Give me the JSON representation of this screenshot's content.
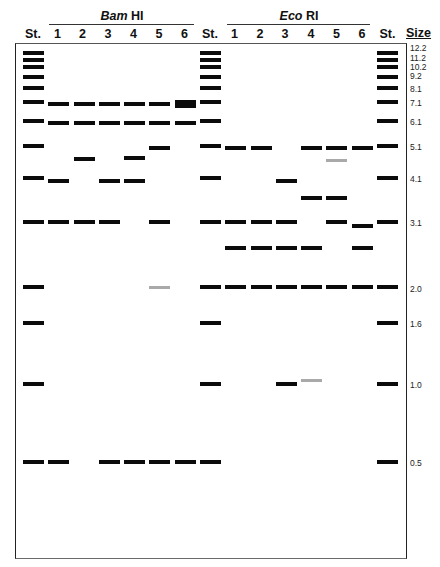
{
  "figure": {
    "groups": {
      "bamhi": {
        "name_italic": "Bam",
        "name_rest": "HI"
      },
      "ecori": {
        "name_italic": "Eco",
        "name_rest": "RI"
      }
    },
    "size_header": "Size",
    "lanes": [
      {
        "label": "St.",
        "enzyme": "standard",
        "bands": "ladder"
      },
      {
        "label": "1",
        "enzyme": "BamHI",
        "bands": [
          {
            "kb": 7.0
          },
          {
            "kb": 6.0
          },
          {
            "kb": 4.0
          },
          {
            "kb": 3.1
          },
          {
            "kb": 0.5
          }
        ]
      },
      {
        "label": "2",
        "enzyme": "BamHI",
        "bands": [
          {
            "kb": 7.0
          },
          {
            "kb": 6.0
          },
          {
            "kb": 4.65
          },
          {
            "kb": 3.1
          }
        ]
      },
      {
        "label": "3",
        "enzyme": "BamHI",
        "bands": [
          {
            "kb": 7.0
          },
          {
            "kb": 6.0
          },
          {
            "kb": 4.0
          },
          {
            "kb": 3.1
          },
          {
            "kb": 0.5
          }
        ]
      },
      {
        "label": "4",
        "enzyme": "BamHI",
        "bands": [
          {
            "kb": 7.0
          },
          {
            "kb": 6.0
          },
          {
            "kb": 4.7
          },
          {
            "kb": 4.0
          },
          {
            "kb": 0.5
          }
        ]
      },
      {
        "label": "5",
        "enzyme": "BamHI",
        "bands": [
          {
            "kb": 7.0
          },
          {
            "kb": 6.0
          },
          {
            "kb": 5.0
          },
          {
            "kb": 3.1
          },
          {
            "kb": 2.0,
            "faint": true
          },
          {
            "kb": 0.5
          }
        ]
      },
      {
        "label": "6",
        "enzyme": "BamHI",
        "bands": [
          {
            "kb": 7.0,
            "thick": true
          },
          {
            "kb": 6.0
          },
          {
            "kb": 0.5
          }
        ]
      },
      {
        "label": "St.",
        "enzyme": "standard",
        "bands": "ladder"
      },
      {
        "label": "1",
        "enzyme": "EcoRI",
        "bands": [
          {
            "kb": 5.0
          },
          {
            "kb": 3.1
          },
          {
            "kb": 2.6
          },
          {
            "kb": 2.0
          }
        ]
      },
      {
        "label": "2",
        "enzyme": "EcoRI",
        "bands": [
          {
            "kb": 5.0
          },
          {
            "kb": 3.1
          },
          {
            "kb": 2.6
          },
          {
            "kb": 2.0
          }
        ]
      },
      {
        "label": "3",
        "enzyme": "EcoRI",
        "bands": [
          {
            "kb": 4.0
          },
          {
            "kb": 3.1
          },
          {
            "kb": 2.6
          },
          {
            "kb": 2.0
          },
          {
            "kb": 1.0
          }
        ]
      },
      {
        "label": "4",
        "enzyme": "EcoRI",
        "bands": [
          {
            "kb": 5.0
          },
          {
            "kb": 3.6
          },
          {
            "kb": 2.6
          },
          {
            "kb": 2.0
          },
          {
            "kb": 1.03,
            "faint": true
          }
        ]
      },
      {
        "label": "5",
        "enzyme": "EcoRI",
        "bands": [
          {
            "kb": 5.0
          },
          {
            "kb": 4.6,
            "faint": true
          },
          {
            "kb": 3.6
          },
          {
            "kb": 3.1
          },
          {
            "kb": 2.0
          }
        ]
      },
      {
        "label": "6",
        "enzyme": "EcoRI",
        "bands": [
          {
            "kb": 5.0
          },
          {
            "kb": 3.0
          },
          {
            "kb": 2.6
          },
          {
            "kb": 2.0
          }
        ]
      },
      {
        "label": "St.",
        "enzyme": "standard",
        "bands": "ladder"
      }
    ],
    "size_scale": {
      "markers": [
        {
          "label": "12.2",
          "kb": 12.2,
          "y": 52.5,
          "label_y": 47.5
        },
        {
          "label": "11.2",
          "kb": 11.2,
          "y": 60,
          "label_y": 57.5
        },
        {
          "label": "10.2",
          "kb": 10.2,
          "y": 66.5,
          "label_y": 66.5
        },
        {
          "label": "9.2",
          "kb": 9.2,
          "y": 76.5,
          "label_y": 75.5
        },
        {
          "label": "8.1",
          "kb": 8.1,
          "y": 88,
          "label_y": 89
        },
        {
          "label": "7.1",
          "kb": 7.1,
          "y": 102,
          "label_y": 102.5
        },
        {
          "label": "6.1",
          "kb": 6.1,
          "y": 121,
          "label_y": 122
        },
        {
          "label": "5.1",
          "kb": 5.1,
          "y": 145.5,
          "label_y": 147
        },
        {
          "label": "4.1",
          "kb": 4.1,
          "y": 177.5,
          "label_y": 179
        },
        {
          "label": "3.1",
          "kb": 3.1,
          "y": 221.5,
          "label_y": 223
        },
        {
          "label": "2.0",
          "kb": 2.0,
          "y": 287,
          "label_y": 288.5
        },
        {
          "label": "1.6",
          "kb": 1.6,
          "y": 323,
          "label_y": 324
        },
        {
          "label": "1.0",
          "kb": 1.0,
          "y": 384,
          "label_y": 384.5
        },
        {
          "label": "0.5",
          "kb": 0.5,
          "y": 462,
          "label_y": 463
        }
      ]
    },
    "colors": {
      "band": "#0b0b0b",
      "faint_band": "#a9a9a9",
      "frame": "#333333"
    }
  }
}
